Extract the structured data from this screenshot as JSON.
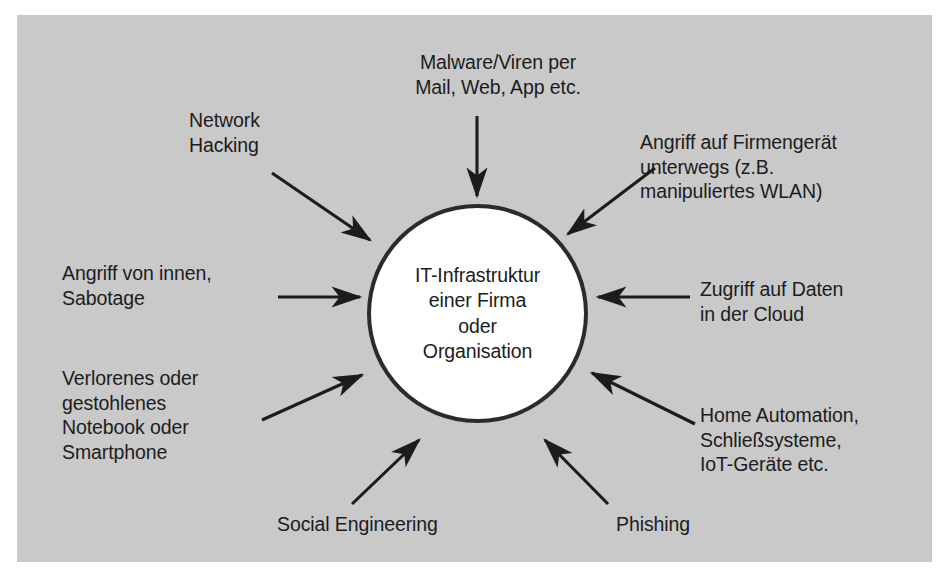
{
  "diagram": {
    "panel_color": "#c9c9c9",
    "node_fill": "#ffffff",
    "stroke_color": "#2b2b2b",
    "text_color": "#1c1c1c"
  },
  "center": {
    "label": "IT-Infrastruktur\neiner Firma\noder\nOrganisation"
  },
  "threats": [
    {
      "id": "malware",
      "label": "Malware/Viren per\nMail, Web, App etc.",
      "position": "top",
      "arrow": "down"
    },
    {
      "id": "network-hacking",
      "label": "Network\nHacking",
      "position": "top-left",
      "arrow": "down-right"
    },
    {
      "id": "mobile-device-attack",
      "label": "Angriff auf Firmengerät\nunterwegs (z.B.\nmanipuliertes WLAN)",
      "position": "top-right",
      "arrow": "down-left"
    },
    {
      "id": "insider-attack",
      "label": "Angriff von innen,\nSabotage",
      "position": "left",
      "arrow": "right"
    },
    {
      "id": "cloud-data-access",
      "label": "Zugriff auf Daten\nin der Cloud",
      "position": "right",
      "arrow": "left"
    },
    {
      "id": "lost-device",
      "label": "Verlorenes oder\ngestohlenes\nNotebook oder\nSmartphone",
      "position": "bottom-left",
      "arrow": "up-right"
    },
    {
      "id": "iot",
      "label": "Home Automation,\nSchließsysteme,\nIoT-Geräte etc.",
      "position": "bottom-right",
      "arrow": "up-left"
    },
    {
      "id": "social-engineering",
      "label": "Social Engineering",
      "position": "bottom",
      "arrow": "up-right"
    },
    {
      "id": "phishing",
      "label": "Phishing",
      "position": "bottom",
      "arrow": "up-left"
    }
  ]
}
